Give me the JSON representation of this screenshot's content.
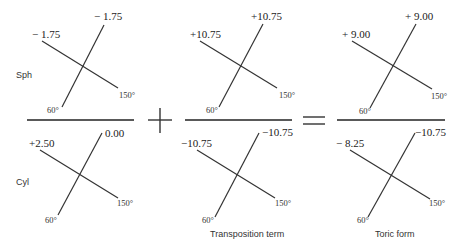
{
  "row_labels": {
    "sph": "Sph",
    "cyl": "Cyl"
  },
  "operators": {
    "plus": "+",
    "equals": "="
  },
  "columns": [
    {
      "caption": "",
      "sph": {
        "left_value": "− 1.75",
        "top_value": "− 1.75",
        "axis_low": "60°",
        "axis_high": "150°"
      },
      "cyl": {
        "left_value": "+2.50",
        "top_value": "0.00",
        "axis_low": "60°",
        "axis_high": "150°"
      }
    },
    {
      "caption": "Transposition term",
      "sph": {
        "left_value": "+10.75",
        "top_value": "+10.75",
        "axis_low": "60°",
        "axis_high": "150°"
      },
      "cyl": {
        "left_value": "−10.75",
        "top_value": "−10.75",
        "axis_low": "60°",
        "axis_high": "150°"
      }
    },
    {
      "caption": "Toric form",
      "sph": {
        "left_value": "+ 9.00",
        "top_value": "+ 9.00",
        "axis_low": "60°",
        "axis_high": "150°"
      },
      "cyl": {
        "left_value": "− 8.25",
        "top_value": "−10.75",
        "axis_low": "60°",
        "axis_high": "150°"
      }
    }
  ]
}
